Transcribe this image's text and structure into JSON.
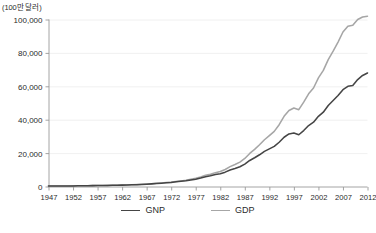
{
  "chart_data": {
    "type": "line",
    "title": "",
    "subtitle": "",
    "xlabel": "",
    "ylabel": "(100만 달러)",
    "unit_label": "(100만 달러)",
    "xlim": [
      1947,
      2012
    ],
    "ylim": [
      0,
      100000
    ],
    "grid": true,
    "legend_position": "bottom-center",
    "y_ticks": [
      0,
      20000,
      40000,
      60000,
      80000,
      100000
    ],
    "y_tick_labels": [
      "0",
      "20,000",
      "40,000",
      "60,000",
      "80,000",
      "100,000"
    ],
    "x_ticks": [
      1947,
      1952,
      1957,
      1962,
      1967,
      1972,
      1977,
      1982,
      1987,
      1992,
      1997,
      2002,
      2007,
      2012
    ],
    "x_tick_labels": [
      "1947",
      "1952",
      "1957",
      "1962",
      "1967",
      "1972",
      "1977",
      "1982",
      "1987",
      "1992",
      "1997",
      "2002",
      "2007",
      "2012"
    ],
    "x": [
      1947,
      1948,
      1949,
      1950,
      1951,
      1952,
      1953,
      1954,
      1955,
      1956,
      1957,
      1958,
      1959,
      1960,
      1961,
      1962,
      1963,
      1964,
      1965,
      1966,
      1967,
      1968,
      1969,
      1970,
      1971,
      1972,
      1973,
      1974,
      1975,
      1976,
      1977,
      1978,
      1979,
      1980,
      1981,
      1982,
      1983,
      1984,
      1985,
      1986,
      1987,
      1988,
      1989,
      1990,
      1991,
      1992,
      1993,
      1994,
      1995,
      1996,
      1997,
      1998,
      1999,
      2000,
      2001,
      2002,
      2003,
      2004,
      2005,
      2006,
      2007,
      2008,
      2009,
      2010,
      2011,
      2012
    ],
    "series": [
      {
        "name": "GNP",
        "color": "#454545",
        "values": [
          250,
          270,
          290,
          300,
          330,
          360,
          400,
          440,
          480,
          520,
          570,
          610,
          660,
          710,
          760,
          830,
          910,
          1000,
          1100,
          1250,
          1400,
          1580,
          1800,
          2000,
          2200,
          2450,
          2800,
          3100,
          3400,
          3900,
          4400,
          5100,
          5900,
          6400,
          7200,
          7700,
          8600,
          9900,
          10800,
          11800,
          13400,
          15600,
          17200,
          19000,
          21000,
          22500,
          24000,
          26500,
          29500,
          31500,
          32000,
          31000,
          33500,
          36500,
          38500,
          42000,
          44500,
          48500,
          51500,
          54500,
          58000,
          60000,
          60500,
          64000,
          66500,
          68000
        ]
      },
      {
        "name": "GDP",
        "color": "#a6a6a6",
        "values": [
          240,
          265,
          285,
          300,
          335,
          365,
          410,
          450,
          490,
          535,
          585,
          625,
          680,
          730,
          785,
          860,
          950,
          1050,
          1160,
          1320,
          1480,
          1680,
          1900,
          2120,
          2350,
          2620,
          3000,
          3350,
          3700,
          4300,
          4900,
          5700,
          6700,
          7300,
          8300,
          9000,
          10200,
          11900,
          13200,
          14600,
          16800,
          19800,
          22200,
          25000,
          28000,
          30500,
          33000,
          37000,
          42000,
          45500,
          47000,
          46000,
          50500,
          55500,
          59000,
          65000,
          69500,
          76000,
          81000,
          86500,
          92500,
          96000,
          96500,
          100000,
          101500,
          102000
        ]
      }
    ]
  },
  "legend": {
    "entries": [
      {
        "label": "GNP",
        "color": "#454545"
      },
      {
        "label": "GDP",
        "color": "#a6a6a6"
      }
    ]
  }
}
